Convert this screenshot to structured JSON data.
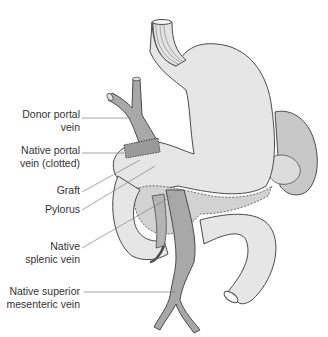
{
  "diagram": {
    "colors": {
      "organ_fill": "#e6e6e6",
      "vein_fill": "#a8a8a8",
      "outline": "#4a4a4a",
      "leader_line": "#808080",
      "label_text": "#333333"
    },
    "labels": [
      {
        "id": "donor-portal-vein",
        "line1": "Donor portal",
        "line2": "vein"
      },
      {
        "id": "native-portal-vein",
        "line1": "Native portal",
        "line2": "vein (clotted)"
      },
      {
        "id": "graft",
        "line1": "Graft",
        "line2": ""
      },
      {
        "id": "pylorus",
        "line1": "Pylorus",
        "line2": ""
      },
      {
        "id": "native-splenic-vein",
        "line1": "Native",
        "line2": "splenic vein"
      },
      {
        "id": "native-sMV",
        "line1": "Native superior",
        "line2": "mesenteric vein"
      }
    ]
  }
}
